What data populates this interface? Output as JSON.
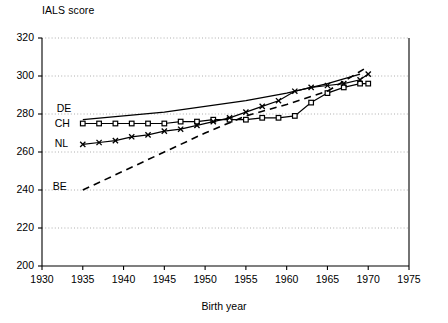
{
  "chart_data": {
    "type": "line",
    "title": "IALS score",
    "xlabel": "Birth year",
    "ylabel": "IALS score",
    "xlim": [
      1930,
      1975
    ],
    "ylim": [
      200,
      320
    ],
    "xticks": [
      1930,
      1935,
      1940,
      1945,
      1950,
      1955,
      1960,
      1965,
      1970,
      1975
    ],
    "yticks": [
      200,
      220,
      240,
      260,
      280,
      300,
      320
    ],
    "grid": "horizontal dotted gridlines at each y tick",
    "legend_position": "inline labels at left of each curve",
    "series": [
      {
        "name": "DE",
        "label": "DE",
        "style": "solid line, no markers",
        "x": [
          1935,
          1940,
          1945,
          1950,
          1955,
          1960,
          1965,
          1969
        ],
        "values": [
          277,
          279,
          281,
          284,
          287,
          291,
          296,
          301
        ]
      },
      {
        "name": "CH",
        "label": "CH",
        "style": "solid line with open square markers",
        "x": [
          1935,
          1937,
          1939,
          1941,
          1943,
          1945,
          1947,
          1949,
          1951,
          1953,
          1955,
          1957,
          1959,
          1961,
          1963,
          1965,
          1967,
          1969,
          1970
        ],
        "values": [
          275,
          275,
          275,
          275,
          275,
          275,
          276,
          276,
          277,
          277,
          277,
          278,
          278,
          279,
          286,
          291,
          294,
          296,
          296
        ]
      },
      {
        "name": "NL",
        "label": "NL",
        "style": "solid line with x markers",
        "x": [
          1935,
          1937,
          1939,
          1941,
          1943,
          1945,
          1947,
          1949,
          1951,
          1953,
          1955,
          1957,
          1959,
          1961,
          1963,
          1965,
          1967,
          1969,
          1970
        ],
        "values": [
          264,
          265,
          266,
          268,
          269,
          271,
          272,
          274,
          276,
          278,
          281,
          284,
          287,
          292,
          294,
          295,
          296,
          298,
          301
        ]
      },
      {
        "name": "BE",
        "label": "BE",
        "style": "dashed line, no markers",
        "x": [
          1935,
          1940,
          1945,
          1950,
          1955,
          1960,
          1965,
          1970
        ],
        "values": [
          240,
          250,
          260,
          270,
          279,
          285,
          292,
          305
        ]
      }
    ]
  },
  "labels": {
    "title": "IALS score",
    "xaxis_title": "Birth year",
    "de": "DE",
    "ch": "CH",
    "nl": "NL",
    "be": "BE"
  },
  "axis": {
    "y": [
      "320",
      "300",
      "280",
      "260",
      "240",
      "220",
      "200"
    ],
    "x": [
      "1930",
      "1935",
      "1940",
      "1945",
      "1950",
      "1955",
      "1960",
      "1965",
      "1970",
      "1975"
    ]
  },
  "colors": {
    "ink": "#000000",
    "grid": "#9a9a9a",
    "background": "#ffffff"
  }
}
